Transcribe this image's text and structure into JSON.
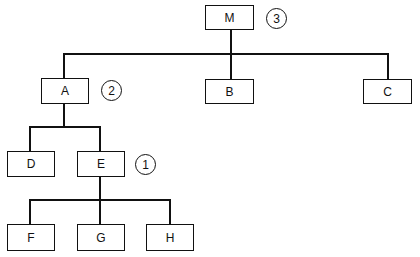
{
  "diagram": {
    "type": "tree",
    "title": "",
    "colors": {
      "stroke": "#111111",
      "background": "#ffffff"
    },
    "nodes": [
      {
        "id": "M",
        "label": "M",
        "parent": null
      },
      {
        "id": "A",
        "label": "A",
        "parent": "M"
      },
      {
        "id": "B",
        "label": "B",
        "parent": "M"
      },
      {
        "id": "C",
        "label": "C",
        "parent": "M"
      },
      {
        "id": "D",
        "label": "D",
        "parent": "A"
      },
      {
        "id": "E",
        "label": "E",
        "parent": "A"
      },
      {
        "id": "F",
        "label": "F",
        "parent": "E"
      },
      {
        "id": "G",
        "label": "G",
        "parent": "E"
      },
      {
        "id": "H",
        "label": "H",
        "parent": "E"
      }
    ],
    "markers": [
      {
        "node": "M",
        "label": "3"
      },
      {
        "node": "A",
        "label": "2"
      },
      {
        "node": "E",
        "label": "1"
      }
    ]
  }
}
